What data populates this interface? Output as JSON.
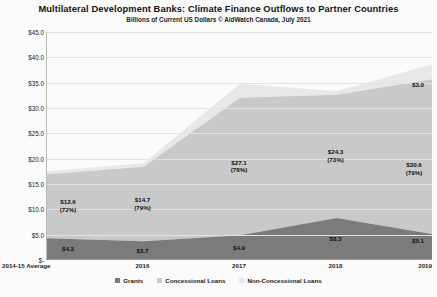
{
  "header": {
    "title": "Multilateral Development Banks:  Climate Finance Outflows to Partner Countries",
    "subtitle": "Billions of Current US Dollars    © AidWatch Canada, July 2021"
  },
  "legend": {
    "position": "bottom",
    "items": [
      {
        "label": "Grants",
        "color": "#7b7b7b"
      },
      {
        "label": "Concessional Loans",
        "color": "#c9c9c9"
      },
      {
        "label": "Non-Concessional Loans",
        "color": "#e8e8e8"
      }
    ]
  },
  "chart_data": {
    "type": "area",
    "stacked": true,
    "title": "Multilateral Development Banks:  Climate Finance Outflows to Partner Countries",
    "subtitle": "Billions of Current US Dollars    © AidWatch Canada, July 2021",
    "xlabel": "",
    "ylabel": "",
    "categories": [
      "2014-15 Average",
      "2016",
      "2017",
      "2018",
      "2019"
    ],
    "ylim": [
      0,
      45
    ],
    "yticks": [
      0,
      5,
      10,
      15,
      20,
      25,
      30,
      35,
      40,
      45
    ],
    "ytick_labels": [
      "$-",
      "$5.0",
      "$10.0",
      "$15.0",
      "$20.0",
      "$25.0",
      "$30.0",
      "$35.0",
      "$40.0",
      "$45.0"
    ],
    "grid": true,
    "series": [
      {
        "name": "Grants",
        "color": "#7b7b7b",
        "values": [
          4.3,
          3.7,
          4.9,
          8.3,
          5.1
        ]
      },
      {
        "name": "Concessional Loans",
        "color": "#c9c9c9",
        "values": [
          12.6,
          14.7,
          27.1,
          24.3,
          30.6
        ]
      },
      {
        "name": "Non-Concessional Loans",
        "color": "#e8e8e8",
        "values": [
          0.6,
          0.7,
          2.8,
          0.7,
          3.0
        ]
      }
    ],
    "annotations": [
      {
        "series": "Concessional Loans",
        "category": "2014-15 Average",
        "value": "$12.6",
        "share": "(72%)"
      },
      {
        "series": "Concessional Loans",
        "category": "2016",
        "value": "$14.7",
        "share": "(79%)"
      },
      {
        "series": "Concessional Loans",
        "category": "2017",
        "value": "$27.1",
        "share": "(78%)"
      },
      {
        "series": "Concessional Loans",
        "category": "2018",
        "value": "$24.3",
        "share": "(73%)"
      },
      {
        "series": "Concessional Loans",
        "category": "2019",
        "value": "$30.6",
        "share": "(79%)"
      },
      {
        "series": "Grants",
        "category": "2014-15 Average",
        "value": "$4.3",
        "share": ""
      },
      {
        "series": "Grants",
        "category": "2016",
        "value": "$3.7",
        "share": ""
      },
      {
        "series": "Grants",
        "category": "2017",
        "value": "$4.9",
        "share": ""
      },
      {
        "series": "Grants",
        "category": "2018",
        "value": "$8.3",
        "share": ""
      },
      {
        "series": "Grants",
        "category": "2019",
        "value": "$5.1",
        "share": ""
      },
      {
        "series": "Non-Concessional Loans",
        "category": "2019",
        "value": "$3.0",
        "share": ""
      }
    ]
  },
  "labels": {
    "p0_conc_value": "$12.6",
    "p0_conc_share": "(72%)",
    "p1_conc_value": "$14.7",
    "p1_conc_share": "(79%)",
    "p2_conc_value": "$27.1",
    "p2_conc_share": "(78%)",
    "p3_conc_value": "$24.3",
    "p3_conc_share": "(73%)",
    "p4_conc_value": "$30.6",
    "p4_conc_share": "(79%)",
    "p0_grant": "$4.3",
    "p1_grant": "$3.7",
    "p2_grant": "$4.9",
    "p3_grant": "$8.3",
    "p4_grant": "$5.1",
    "p4_nonconc": "$3.0"
  }
}
